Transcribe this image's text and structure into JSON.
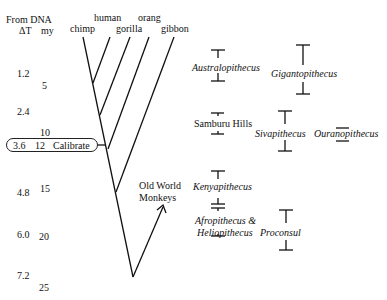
{
  "header": {
    "from_dna": "From DNA",
    "delta_t": "ΔT",
    "my": "my"
  },
  "taxa": {
    "chimp": "chimp",
    "human": "human",
    "orang": "orang",
    "gorilla": "gorilla",
    "gibbon": "gibbon",
    "owm_line1": "Old World",
    "owm_line2": "Monkeys"
  },
  "scale": {
    "delta_t": [
      "1.2",
      "2.4",
      "3.6",
      "4.8",
      "6.0",
      "7.2"
    ],
    "my": [
      "5",
      "10",
      "12",
      "15",
      "20",
      "25"
    ]
  },
  "calibrate": {
    "dt": "3.6",
    "my": "12",
    "label": "Calibrate"
  },
  "fossils": {
    "australopithecus": "Australopithecus",
    "gigantopithecus": "Gigantopithecus",
    "samburu": "Samburu Hills",
    "sivapithecus": "Sivapithecus",
    "ouranopithecus": "Ouranopithecus",
    "kenyapithecus": "Kenyapithecus",
    "afro_line1": "Afropithecus &",
    "afro_line2": "Heliopithecus",
    "proconsul": "Proconsul"
  }
}
